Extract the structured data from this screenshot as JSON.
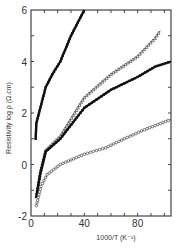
{
  "chart_data": {
    "type": "scatter",
    "title": "",
    "xlabel": "1000/T (K⁻¹)",
    "ylabel": "Resistivity log ρ (Ω.cm)",
    "xlim": [
      0,
      105
    ],
    "ylim": [
      -2,
      6
    ],
    "x_ticks": [
      0,
      40,
      80
    ],
    "x_tick_labels": [
      "0",
      "40",
      "80"
    ],
    "y_ticks": [
      -2,
      0,
      2,
      4,
      6
    ],
    "y_tick_labels": [
      "-2",
      "0",
      "2",
      "4",
      "6"
    ],
    "grid": false,
    "legend": "none",
    "series": [
      {
        "name": "series-1",
        "marker": "filled-square",
        "x": [
          3.5,
          4,
          6,
          11,
          16,
          22,
          30,
          40
        ],
        "y": [
          1.0,
          1.6,
          2.0,
          3.0,
          3.5,
          4.0,
          5.0,
          6.0
        ]
      },
      {
        "name": "series-2",
        "marker": "open-triangle",
        "x": [
          4,
          7,
          11,
          22,
          40,
          60,
          80,
          93,
          97
        ],
        "y": [
          -1.25,
          -0.3,
          0.55,
          1.1,
          2.6,
          3.5,
          4.2,
          4.9,
          5.2
        ]
      },
      {
        "name": "series-3",
        "marker": "filled-square",
        "x": [
          4,
          7,
          11,
          22,
          40,
          60,
          80,
          93,
          105
        ],
        "y": [
          -1.25,
          -0.35,
          0.5,
          1.0,
          2.2,
          2.9,
          3.4,
          3.8,
          4.0
        ]
      },
      {
        "name": "series-4",
        "marker": "open-circle",
        "x": [
          4,
          7.5,
          12,
          22,
          40,
          56,
          70,
          85,
          105
        ],
        "y": [
          -1.6,
          -0.85,
          -0.4,
          0.0,
          0.4,
          0.65,
          1.0,
          1.35,
          1.75
        ]
      }
    ]
  }
}
